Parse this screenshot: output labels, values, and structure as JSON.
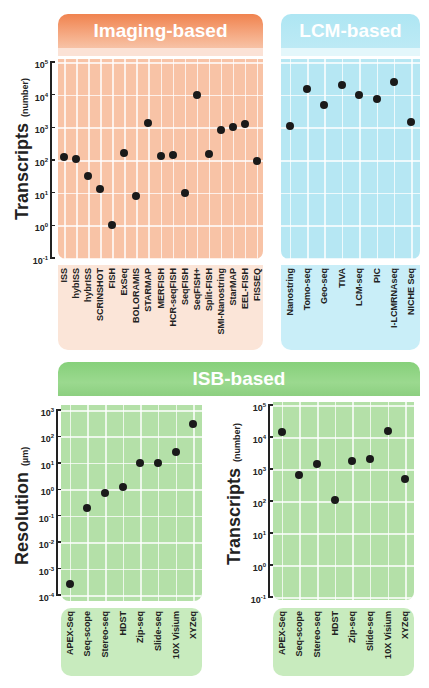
{
  "panels": {
    "imaging": {
      "title": "Imaging-based",
      "color": "#f0834f"
    },
    "lcm": {
      "title": "LCM-based",
      "color": "#aee6f3"
    },
    "isb": {
      "title": "ISB-based",
      "color": "#86d07a"
    }
  },
  "axes": {
    "transcripts_title": "Transcripts",
    "transcripts_unit": "(number)",
    "resolution_title": "Resolution",
    "resolution_unit": "(µm)"
  },
  "chart_data": [
    {
      "type": "scatter",
      "title": "Imaging-based",
      "ylabel": "Transcripts (number)",
      "yscale": "log",
      "ylim": [
        0.1,
        100000
      ],
      "yticks": [
        "10^-1",
        "10^0",
        "10^1",
        "10^2",
        "10^3",
        "10^4",
        "10^5"
      ],
      "categories": [
        "ISS",
        "hybISS",
        "hybrISS",
        "SCRINSHOT",
        "FISH",
        "ExSeq",
        "BOLORAMIS",
        "STARMAP",
        "MERFISH",
        "HCR-seqFISH",
        "SeqFISH",
        "SeqFISH+",
        "Split-FISH",
        "SMI-Nanostring",
        "StarMAP",
        "EEL-FISH",
        "FISSEQ"
      ],
      "values": [
        120,
        105,
        32,
        13,
        1,
        160,
        8,
        1400,
        130,
        145,
        10,
        10000,
        150,
        850,
        1000,
        1250,
        95
      ]
    },
    {
      "type": "scatter",
      "title": "LCM-based",
      "ylabel": "Transcripts (number)",
      "yscale": "log",
      "ylim": [
        0.1,
        100000
      ],
      "categories": [
        "Nanostring",
        "Tomo-seq",
        "Geo-seq",
        "TIVA",
        "LCM-seq",
        "PIC",
        "I-LCMRNAseq",
        "NICHE Seq"
      ],
      "values": [
        1100,
        15000,
        5000,
        20000,
        9500,
        7500,
        24000,
        1500
      ]
    },
    {
      "type": "scatter",
      "title": "ISB-based",
      "ylabel": "Resolution (µm)",
      "yscale": "log",
      "ylim": [
        0.0001,
        1000
      ],
      "yticks": [
        "10^-4",
        "10^-3",
        "10^-2",
        "10^-1",
        "10^0",
        "10^1",
        "10^2",
        "10^3"
      ],
      "categories": [
        "APEX-Seq",
        "Seq-scope",
        "Stereo-seq",
        "HDST",
        "Zip-seq",
        "Slide-seq",
        "10X Visium",
        "XYZeq"
      ],
      "values": [
        0.00025,
        0.2,
        0.7,
        1.2,
        10,
        10,
        25,
        300
      ]
    },
    {
      "type": "scatter",
      "title": "ISB-based",
      "ylabel": "Transcripts (number)",
      "yscale": "log",
      "ylim": [
        0.1,
        100000
      ],
      "yticks": [
        "10^-1",
        "10^0",
        "10^1",
        "10^2",
        "10^3",
        "10^4",
        "10^5"
      ],
      "categories": [
        "APEX-Seq",
        "Seq-scope",
        "Stereo-seq",
        "HDST",
        "Zip-seq",
        "Slide-seq",
        "10X Visium",
        "XYZeq"
      ],
      "values": [
        14000,
        650,
        1400,
        110,
        1800,
        2100,
        15000,
        500
      ]
    }
  ]
}
